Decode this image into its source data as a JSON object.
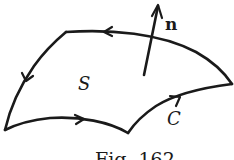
{
  "figure": {
    "caption": "Fig. 162",
    "labels": {
      "surface": "S",
      "curve": "C",
      "normal": "n"
    },
    "colors": {
      "stroke": "#1a1a1a",
      "background": "#ffffff"
    }
  }
}
